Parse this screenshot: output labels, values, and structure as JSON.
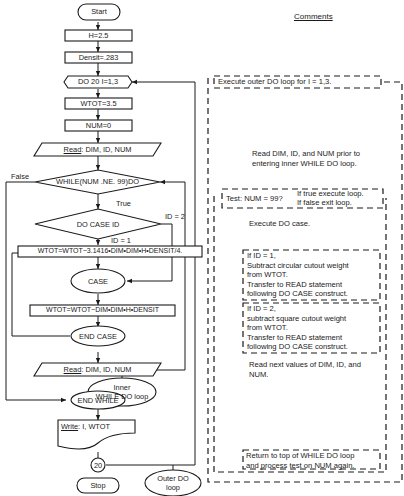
{
  "comments_heading": "Comments",
  "flowchart": {
    "start": "Start",
    "h_assign": "H=2.5",
    "densit_assign": "Densit=.283",
    "do_loop": "DO 20 I=1,3",
    "wtot_assign": "WTOT=3.5",
    "num_assign": "NUM=0",
    "read1_keyword": "Read",
    "read1_rest": ": DIM, ID, NUM",
    "while": "WHILE(NUM .NE. 99)DO",
    "false_label": "False",
    "true_label": "True",
    "do_case": "DO CASE ID",
    "id2_label": "ID = 2",
    "id1_label": "ID = 1",
    "calc1": "WTOT=WTOT−3.1416•DIM•DIM•H•DENSIT/4.",
    "case": "CASE",
    "calc2": "WTOT=WTOT−DIM•DIM•H•DENSIT",
    "end_case": "END CASE",
    "read2_keyword": "Read",
    "read2_rest": ": DIM, ID, NUM",
    "inner_loop_line1": "Inner",
    "inner_loop_line2": "WHILE DO loop",
    "end_while": "END WHILE",
    "write_keyword": "Write",
    "write_rest": ": I, WTOT",
    "connector": "20",
    "stop": "Stop",
    "outer_loop_line1": "Outer DO",
    "outer_loop_line2": "loop"
  },
  "comments": {
    "outer_do": "Execute outer DO loop for I = 1,3.",
    "read_prior": [
      "Read DIM, ID, and NUM prior to",
      "entering inner WHILE DO loop."
    ],
    "test_label": "Test: NUM = 99?",
    "test_true": "If true execute loop.",
    "test_false": "If false exit loop.",
    "execute_case": "Execute DO case.",
    "id1_block": [
      "If ID = 1,",
      "Subtract circular cutout weight",
      "from WTOT.",
      "Transfer to READ statement",
      "following DO CASE construct."
    ],
    "id2_block": [
      "If ID = 2,",
      "subtract square cutout weight",
      "from WTOT.",
      "Transfer to READ statement",
      "following DO CASE construct."
    ],
    "read_next": [
      "Read next values of DIM, ID, and",
      "NUM."
    ],
    "return_top": [
      "Return to top of WHILE DO loop",
      "and process test on NUM again."
    ]
  }
}
